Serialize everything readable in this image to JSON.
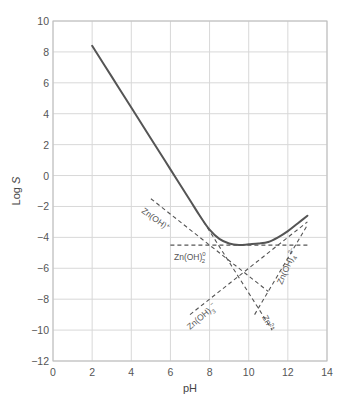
{
  "chart_data": {
    "type": "line",
    "title": "",
    "xlabel": "pH",
    "ylabel": "Log S",
    "xlim": [
      0,
      14
    ],
    "ylim": [
      -12,
      10
    ],
    "xticks": [
      0,
      2,
      4,
      6,
      8,
      10,
      12,
      14
    ],
    "yticks": [
      10,
      8,
      6,
      4,
      2,
      0,
      -2,
      -4,
      -6,
      -8,
      -10,
      -12
    ],
    "grid": true,
    "legend": "none (inline labels)",
    "series": [
      {
        "name": "Total solubility",
        "style": "solid",
        "x": [
          2,
          3,
          4,
          5,
          6,
          7,
          7.5,
          8,
          8.5,
          9,
          9.5,
          10,
          10.5,
          11,
          11.5,
          12,
          12.5,
          13
        ],
        "y": [
          8.4,
          6.4,
          4.4,
          2.4,
          0.4,
          -1.6,
          -2.6,
          -3.5,
          -4.1,
          -4.4,
          -4.5,
          -4.45,
          -4.4,
          -4.3,
          -4.0,
          -3.6,
          -3.1,
          -2.6
        ]
      },
      {
        "name": "Zn(OH)+",
        "style": "dashed",
        "x": [
          5,
          11
        ],
        "y": [
          -1.5,
          -7.5
        ]
      },
      {
        "name": "Zn2+",
        "style": "dashed",
        "x": [
          7.5,
          11.2
        ],
        "y": [
          -2.6,
          -10
        ]
      },
      {
        "name": "Zn(OH)2 0",
        "style": "dashed",
        "x": [
          6,
          13
        ],
        "y": [
          -4.5,
          -4.5
        ]
      },
      {
        "name": "Zn(OH)3-",
        "style": "dashed",
        "x": [
          7,
          13
        ],
        "y": [
          -9,
          -3
        ]
      },
      {
        "name": "Zn(OH)4 2-",
        "style": "dashed",
        "x": [
          10.3,
          13
        ],
        "y": [
          -9,
          -3.2
        ]
      }
    ],
    "annotations": [
      {
        "text": "Zn(OH)+",
        "x": 5.8,
        "y": -3.2,
        "rotation": 35
      },
      {
        "text": "Zn(OH)2 0",
        "x": 6.3,
        "y": -6.3,
        "rotation": 0
      },
      {
        "text": "Zn(OH)3-",
        "x": 7.6,
        "y": -9.7,
        "rotation": -40
      },
      {
        "text": "Zn2+",
        "x": 10.8,
        "y": -10,
        "rotation": 60
      },
      {
        "text": "Zn(OH)4 2-",
        "x": 11.6,
        "y": -6.5,
        "rotation": -65
      }
    ]
  },
  "labels": {
    "xlabel": "pH",
    "ylabel_main": "Log ",
    "ylabel_italic": "S",
    "xticks": [
      "0",
      "2",
      "4",
      "6",
      "8",
      "10",
      "12",
      "14"
    ],
    "yticks": [
      "10",
      "8",
      "6",
      "4",
      "2",
      "0",
      "−2",
      "−4",
      "−6",
      "−8",
      "−10",
      "−12"
    ],
    "species": {
      "zn_oh_plus": {
        "base": "Zn(OH)",
        "sup": "+"
      },
      "zn_oh2": {
        "base": "Zn(OH)",
        "sub": "2",
        "sup": "0"
      },
      "zn_oh3": {
        "base": "Zn(OH)",
        "sub": "3",
        "sup": "−"
      },
      "zn2": {
        "base": "Zn",
        "sup": "2+"
      },
      "zn_oh4": {
        "base": "Zn(OH)",
        "sub": "4",
        "sup": "2−"
      }
    }
  }
}
